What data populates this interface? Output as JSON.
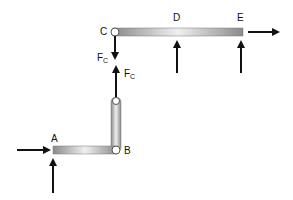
{
  "labels": {
    "C": "C",
    "D": "D",
    "E": "E",
    "A": "A",
    "B": "B",
    "fc_top_main": "F",
    "fc_top_sub": "C",
    "fc_bottom_main": "F",
    "fc_bottom_sub": "C"
  },
  "colors": {
    "bar_dark": "#8a8a8a",
    "bar_light": "#f2f2f2",
    "arrow": "#111111"
  }
}
